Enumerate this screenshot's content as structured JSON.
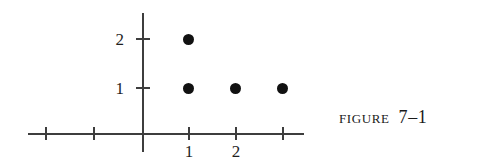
{
  "figure": {
    "caption_word": "Figure",
    "caption_number": "7–1",
    "background_color": "#ffffff",
    "ink_color": "#1a1a1a"
  },
  "chart_data": {
    "type": "scatter",
    "xlabel": "",
    "ylabel": "",
    "grid": false,
    "legend": null,
    "point_color": "#111111",
    "axis_color": "#3d3d3d",
    "xlim": [
      -2.45,
      3.45
    ],
    "ylim": [
      -0.4,
      2.55
    ],
    "x_ticks": [
      -2,
      -1,
      1,
      2,
      3
    ],
    "x_tick_labels": [
      "",
      "",
      "1",
      "2",
      ""
    ],
    "y_ticks": [
      1,
      2
    ],
    "y_tick_labels": [
      "1",
      "2"
    ],
    "points": [
      {
        "x": 1,
        "y": 2
      },
      {
        "x": 1,
        "y": 1
      },
      {
        "x": 2,
        "y": 1
      },
      {
        "x": 3,
        "y": 1
      }
    ],
    "pixel_geometry": {
      "x_axis": {
        "left": 28,
        "top": 133,
        "width": 276
      },
      "y_axis": {
        "left": 142,
        "top": 13,
        "height": 139
      },
      "x_tick_px": [
        46,
        94,
        189,
        236,
        283
      ],
      "y_tick_px": [
        39,
        88
      ],
      "point_px": [
        {
          "left": 188,
          "top": 39
        },
        {
          "left": 188,
          "top": 88
        },
        {
          "left": 235,
          "top": 88
        },
        {
          "left": 282,
          "top": 88
        }
      ],
      "x_label_px": [
        {
          "label": "1",
          "left": 179
        },
        {
          "label": "2",
          "left": 226
        }
      ],
      "y_label_px": [
        {
          "label": "2",
          "top": 31
        },
        {
          "label": "1",
          "top": 80
        }
      ]
    }
  }
}
